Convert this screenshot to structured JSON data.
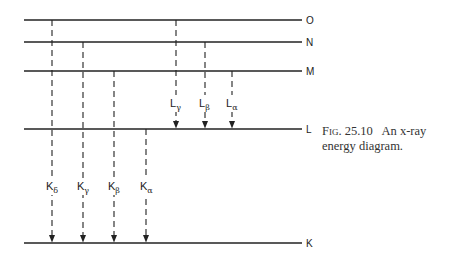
{
  "figure": {
    "levels": [
      {
        "name": "O",
        "y": 20
      },
      {
        "name": "N",
        "y": 42
      },
      {
        "name": "M",
        "y": 71
      },
      {
        "name": "L",
        "y": 129
      },
      {
        "name": "K",
        "y": 243
      }
    ],
    "transitions": [
      {
        "label": "K",
        "sub": "δ",
        "x": 52,
        "from": "O",
        "to": "K"
      },
      {
        "label": "K",
        "sub": "γ",
        "x": 83,
        "from": "N",
        "to": "K"
      },
      {
        "label": "K",
        "sub": "β",
        "x": 114,
        "from": "M",
        "to": "K"
      },
      {
        "label": "K",
        "sub": "α",
        "x": 146,
        "from": "L",
        "to": "K"
      },
      {
        "label": "L",
        "sub": "γ",
        "x": 176,
        "from": "O",
        "to": "L"
      },
      {
        "label": "L",
        "sub": "β",
        "x": 205,
        "from": "N",
        "to": "L"
      },
      {
        "label": "L",
        "sub": "α",
        "x": 232,
        "from": "M",
        "to": "L"
      }
    ],
    "caption": {
      "fig_label": "Fig. 25.10",
      "text": "An x-ray energy diagram."
    }
  }
}
